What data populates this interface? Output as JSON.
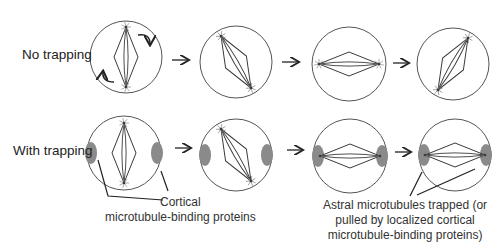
{
  "rows": [
    {
      "label": "No trapping",
      "label_pos": [
        22,
        47
      ],
      "cells": [
        {
          "cx": 126,
          "cy": 57,
          "r": 36,
          "angle": 0,
          "half": 30,
          "width": 12,
          "cortex": false,
          "rotation_arrows": true
        },
        {
          "cx": 236,
          "cy": 62,
          "r": 36,
          "angle": -30,
          "half": 30,
          "width": 12,
          "cortex": false,
          "rotation_arrows": false
        },
        {
          "cx": 349,
          "cy": 64,
          "r": 37,
          "angle": -90,
          "half": 30,
          "width": 12,
          "cortex": false,
          "rotation_arrows": false
        },
        {
          "cx": 453,
          "cy": 64,
          "r": 36,
          "angle": 30,
          "half": 30,
          "width": 12,
          "cortex": false,
          "rotation_arrows": false
        }
      ],
      "arrows": [
        [
          172,
          60,
          188,
          60
        ],
        [
          282,
          62,
          298,
          62
        ],
        [
          393,
          63,
          408,
          63
        ]
      ]
    },
    {
      "label": "With trapping",
      "label_pos": [
        13,
        143
      ],
      "cells": [
        {
          "cx": 124,
          "cy": 153,
          "r": 37,
          "angle": 0,
          "half": 30,
          "width": 12,
          "cortex": true,
          "cortex_pos": [
            [
              -33,
              0
            ],
            [
              33,
              0
            ]
          ],
          "rotation_arrows": false
        },
        {
          "cx": 236,
          "cy": 155,
          "r": 36,
          "angle": -30,
          "half": 30,
          "width": 12,
          "cortex": true,
          "cortex_pos": [
            [
              -31,
              0
            ],
            [
              31,
              0
            ]
          ],
          "rotation_arrows": false
        },
        {
          "cx": 350,
          "cy": 156,
          "r": 37,
          "angle": -90,
          "half": 30,
          "width": 12,
          "cortex": true,
          "cortex_pos": [
            [
              -32,
              0
            ],
            [
              32,
              0
            ]
          ],
          "rotation_arrows": false
        },
        {
          "cx": 455,
          "cy": 155,
          "r": 36,
          "angle": -90,
          "half": 30,
          "width": 12,
          "cortex": true,
          "cortex_pos": [
            [
              -31,
              0
            ],
            [
              31,
              0
            ]
          ],
          "rotation_arrows": false
        }
      ],
      "arrows": [
        [
          175,
          148,
          190,
          148
        ],
        [
          287,
          150,
          302,
          150
        ],
        [
          395,
          152,
          410,
          152
        ]
      ]
    }
  ],
  "captions": {
    "cortical": {
      "lines": [
        "Cortical",
        "microtubule-binding proteins"
      ],
      "pos": [
        105,
        195
      ],
      "leaders": [
        [
          [
            98,
            160
          ],
          [
            108,
            196
          ],
          [
            163,
            200
          ]
        ],
        [
          [
            161,
            171
          ],
          [
            168,
            191
          ]
        ]
      ]
    },
    "astral": {
      "lines": [
        "Astral microtubules trapped (or",
        "pulled by localized cortical",
        "microtubule-binding proteins)"
      ],
      "pos": [
        323,
        198
      ],
      "leaders": [
        [
          [
            422,
            172
          ],
          [
            410,
            196
          ]
        ],
        [
          [
            475,
            169
          ],
          [
            417,
            195
          ]
        ]
      ]
    }
  },
  "colors": {
    "stroke": "#555555",
    "spindle": "#3a3a3a",
    "cortex": "#8a8a8a",
    "text": "#222222",
    "arrow": "#222222"
  }
}
